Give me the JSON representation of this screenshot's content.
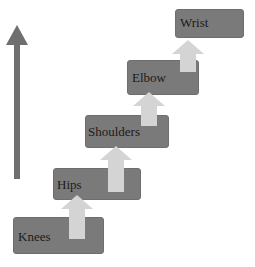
{
  "diagram": {
    "direction_arrow": "up-arrow",
    "steps": [
      {
        "label": "Knees"
      },
      {
        "label": "Hips"
      },
      {
        "label": "Shoulders"
      },
      {
        "label": "Elbow"
      },
      {
        "label": "Wrist"
      }
    ]
  },
  "colors": {
    "box_fill": "#7a7a7a",
    "connector_arrow": "#d4d4d4",
    "direction_arrow": "#6f6f6f",
    "text": "#1a1a1a"
  }
}
